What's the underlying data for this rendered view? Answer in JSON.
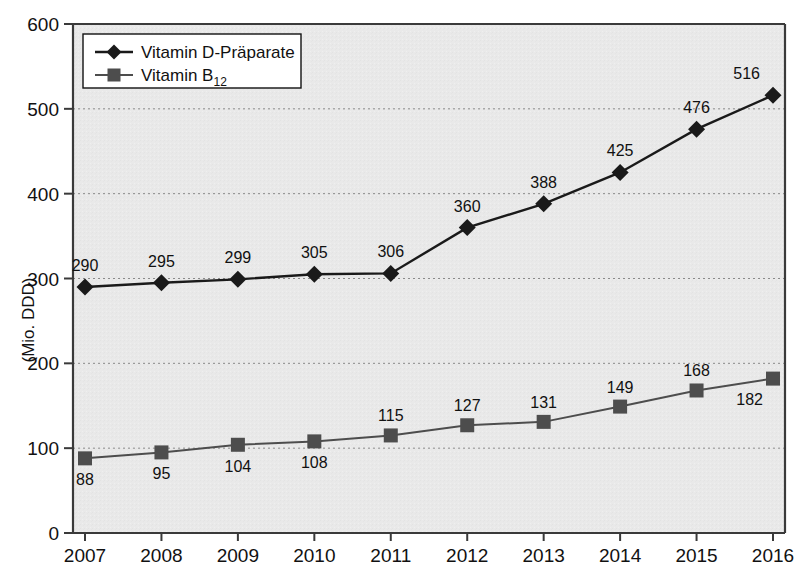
{
  "chart_data": {
    "type": "line",
    "title": "",
    "xlabel": "",
    "ylabel": "(Mio. DDD)",
    "categories": [
      "2007",
      "2008",
      "2009",
      "2010",
      "2011",
      "2012",
      "2013",
      "2014",
      "2015",
      "2016"
    ],
    "x": [
      2007,
      2008,
      2009,
      2010,
      2011,
      2012,
      2013,
      2014,
      2015,
      2016
    ],
    "ylim": [
      0,
      600
    ],
    "yticks": [
      0,
      100,
      200,
      300,
      400,
      500,
      600
    ],
    "ytick_labels": [
      "0",
      "100",
      "200",
      "300",
      "400",
      "500",
      "600"
    ],
    "grid": true,
    "grid_style": "dotted",
    "legend_position": "top-left",
    "series": [
      {
        "name": "Vitamin D-Präparate",
        "marker": "diamond",
        "color": "#1a1a1a",
        "values": [
          290,
          295,
          299,
          305,
          306,
          360,
          388,
          425,
          476,
          516
        ],
        "labels": [
          "290",
          "295",
          "299",
          "305",
          "306",
          "360",
          "388",
          "425",
          "476",
          "516"
        ],
        "label_position": "above"
      },
      {
        "name": "Vitamin B12",
        "name_base": "Vitamin B",
        "name_subscript": "12",
        "marker": "square",
        "color": "#4d4d4d",
        "values": [
          88,
          95,
          104,
          108,
          115,
          127,
          131,
          149,
          168,
          182
        ],
        "labels": [
          "88",
          "95",
          "104",
          "108",
          "115",
          "127",
          "131",
          "149",
          "168",
          "182"
        ],
        "label_position": "mixed"
      }
    ]
  },
  "legend": {
    "entries": [
      {
        "label": "Vitamin D-Präparate",
        "marker": "diamond-marker-icon"
      },
      {
        "label_base": "Vitamin B",
        "label_sub": "12",
        "marker": "square-marker-icon"
      }
    ]
  },
  "axes": {
    "y_axis_title": "(Mio. DDD)",
    "y_tick_labels": [
      "600",
      "500",
      "400",
      "300",
      "200",
      "100",
      "0"
    ],
    "x_tick_labels": [
      "2007",
      "2008",
      "2009",
      "2010",
      "2011",
      "2012",
      "2013",
      "2014",
      "2015",
      "2016"
    ]
  },
  "colors": {
    "plot_background": "#e9e9e9",
    "grid": "#8a8a8a",
    "series_1": "#1a1a1a",
    "series_2": "#4d4d4d",
    "axis": "#3a3a3a",
    "text": "#111111"
  }
}
